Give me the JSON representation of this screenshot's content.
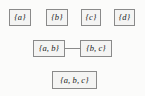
{
  "diagram": {
    "type": "hasse-lattice-diagram",
    "background_color": "#fbfbfa",
    "node_fill_color": "#f4f4f3",
    "node_border_color": "#8a8a8a",
    "edge_color": "#8a8a8a",
    "text_color": "#1a1a1a",
    "rows": [
      {
        "name": "singletons-row",
        "nodes": [
          {
            "label": "{a}",
            "x": 9,
            "y": 9,
            "w": 22,
            "h": 17
          },
          {
            "label": "{b}",
            "x": 46,
            "y": 9,
            "w": 22,
            "h": 17
          },
          {
            "label": "{c}",
            "x": 81,
            "y": 9,
            "w": 20,
            "h": 17
          },
          {
            "label": "{d}",
            "x": 114,
            "y": 9,
            "w": 21,
            "h": 17
          }
        ]
      },
      {
        "name": "pairs-row",
        "nodes": [
          {
            "label": "{a, b}",
            "x": 33,
            "y": 40,
            "w": 32,
            "h": 17
          },
          {
            "label": "{b, c}",
            "x": 80,
            "y": 40,
            "w": 32,
            "h": 17
          }
        ]
      },
      {
        "name": "triple-row",
        "nodes": [
          {
            "label": "{a, b, c}",
            "x": 52,
            "y": 71,
            "w": 45,
            "h": 18
          }
        ]
      }
    ],
    "edges": [
      {
        "name": "edge-ab-bc",
        "x": 65,
        "y": 48,
        "w": 15,
        "h": 1
      }
    ]
  }
}
